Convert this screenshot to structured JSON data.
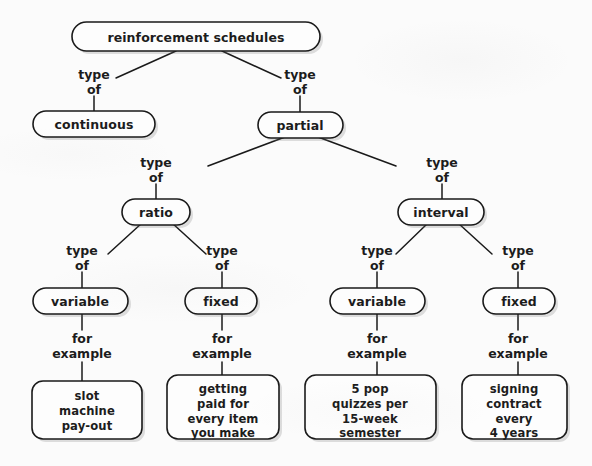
{
  "diagram": {
    "title": "reinforcement schedules",
    "type": "concept-map",
    "background_color": "#fbfbfb",
    "line_color": "#1a1a1a",
    "text_color": "#1c1c1c"
  },
  "nodes": {
    "root": {
      "label": "reinforcement schedules"
    },
    "continuous": {
      "label": "continuous"
    },
    "partial": {
      "label": "partial"
    },
    "ratio": {
      "label": "ratio"
    },
    "interval": {
      "label": "interval"
    },
    "ratio_variable": {
      "label": "variable"
    },
    "ratio_fixed": {
      "label": "fixed"
    },
    "interval_variable": {
      "label": "variable"
    },
    "interval_fixed": {
      "label": "fixed"
    },
    "example_slot_machine": {
      "lines": [
        "slot",
        "machine",
        "pay-out"
      ]
    },
    "example_getting_paid": {
      "lines": [
        "getting",
        "paid for",
        "every item",
        "you make"
      ]
    },
    "example_pop_quizzes": {
      "lines": [
        "5 pop",
        "quizzes per",
        "15-week",
        "semester"
      ]
    },
    "example_signing_contract": {
      "lines": [
        "signing",
        "contract",
        "every",
        "4 years"
      ]
    }
  },
  "links": {
    "root_to_continuous": {
      "line1": "type",
      "line2": "of"
    },
    "root_to_partial": {
      "line1": "type",
      "line2": "of"
    },
    "partial_to_ratio": {
      "line1": "type",
      "line2": "of"
    },
    "partial_to_interval": {
      "line1": "type",
      "line2": "of"
    },
    "ratio_to_variable": {
      "line1": "type",
      "line2": "of"
    },
    "ratio_to_fixed": {
      "line1": "type",
      "line2": "of"
    },
    "interval_to_variable": {
      "line1": "type",
      "line2": "of"
    },
    "interval_to_fixed": {
      "line1": "type",
      "line2": "of"
    },
    "rv_to_example": {
      "line1": "for",
      "line2": "example"
    },
    "rf_to_example": {
      "line1": "for",
      "line2": "example"
    },
    "iv_to_example": {
      "line1": "for",
      "line2": "example"
    },
    "if_to_example": {
      "line1": "for",
      "line2": "example"
    }
  }
}
